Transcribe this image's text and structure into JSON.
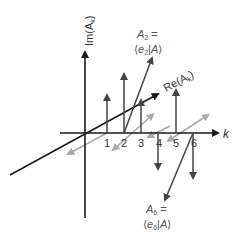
{
  "diagram": {
    "type": "3d-vector-components",
    "axes": {
      "imaginary_axis_label": "Im(A",
      "imaginary_axis_sub": "k",
      "imaginary_axis_close": ")",
      "real_axis_label": "Re(A",
      "real_axis_sub": "k",
      "real_axis_close": ")",
      "k_axis_label": "k"
    },
    "ticks": [
      "1",
      "2",
      "3",
      "4",
      "5",
      "6"
    ],
    "annotations": {
      "a2": {
        "line1_main": "A",
        "line1_sub": "2",
        "line1_eq": " =",
        "line2_open": "⟨",
        "line2_e": "e",
        "line2_sub": "2",
        "line2_bar": "|",
        "line2_A": "A",
        "line2_close": "⟩"
      },
      "a6": {
        "line1_main": "A",
        "line1_sub": "6",
        "line1_eq": " =",
        "line2_open": "⟨",
        "line2_e": "e",
        "line2_sub": "6",
        "line2_bar": "|",
        "line2_A": "A",
        "line2_close": "⟩"
      }
    },
    "colors": {
      "axis": "#1a1a1a",
      "stem": "#444444",
      "real_component": "#aaaaaa",
      "text": "#333333"
    }
  }
}
